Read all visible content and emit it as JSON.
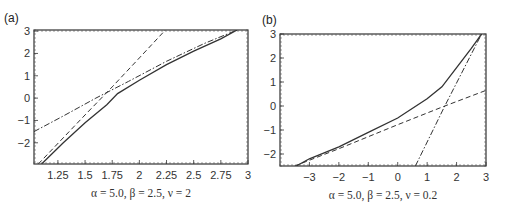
{
  "chart_data": [
    {
      "type": "line",
      "panel_label": "(a)",
      "title": "",
      "xlabel": "α = 5.0, β = 2.5, ν = 2",
      "ylabel": "",
      "xlim": [
        1.03,
        3.0
      ],
      "ylim": [
        -2.95,
        3.05
      ],
      "xticks": [
        1.25,
        1.5,
        1.75,
        2,
        2.25,
        2.5,
        2.75,
        3
      ],
      "xtick_labels": [
        "1.25",
        "1.5",
        "1.75",
        "2",
        "2.25",
        "2.5",
        "2.75",
        "3"
      ],
      "yticks": [
        -2,
        -1,
        0,
        1,
        2,
        3
      ],
      "ytick_labels": [
        "−2",
        "−1",
        "0",
        "1",
        "2",
        "3"
      ],
      "grid": false,
      "legend": null,
      "series": [
        {
          "name": "solid",
          "style": "solid",
          "x": [
            1.1,
            1.3,
            1.5,
            1.7,
            1.8,
            2.0,
            2.25,
            2.5,
            2.75,
            2.9
          ],
          "y": [
            -2.95,
            -2.0,
            -1.1,
            -0.3,
            0.2,
            0.8,
            1.5,
            2.1,
            2.65,
            3.05
          ]
        },
        {
          "name": "dashed",
          "style": "dashed",
          "x": [
            1.07,
            1.5,
            1.75,
            2.0,
            2.24
          ],
          "y": [
            -2.95,
            -0.75,
            0.5,
            1.8,
            3.05
          ]
        },
        {
          "name": "dash-dot",
          "style": "dashdot",
          "x": [
            1.03,
            1.3,
            1.6,
            1.9,
            2.25,
            2.6,
            2.9
          ],
          "y": [
            -1.5,
            -0.8,
            0.0,
            0.75,
            1.65,
            2.45,
            3.05
          ]
        }
      ]
    },
    {
      "type": "line",
      "panel_label": "(b)",
      "title": "",
      "xlabel": "α = 5.0, β = 2.5, ν = 0.2",
      "ylabel": "",
      "xlim": [
        -4.0,
        3.0
      ],
      "ylim": [
        -2.5,
        3.0
      ],
      "xticks": [
        -3,
        -2,
        -1,
        0,
        1,
        2,
        3
      ],
      "xtick_labels": [
        "−3",
        "−2",
        "−1",
        "0",
        "1",
        "2",
        "3"
      ],
      "yticks": [
        -2,
        -1,
        0,
        1,
        2,
        3
      ],
      "ytick_labels": [
        "−2",
        "−1",
        "0",
        "1",
        "2",
        "3"
      ],
      "grid": false,
      "legend": null,
      "series": [
        {
          "name": "solid",
          "style": "solid",
          "x": [
            -3.45,
            -3.0,
            -2.0,
            -1.0,
            0.0,
            1.0,
            1.5,
            2.0,
            2.5,
            2.85
          ],
          "y": [
            -2.5,
            -2.2,
            -1.7,
            -1.1,
            -0.5,
            0.3,
            0.8,
            1.6,
            2.4,
            3.0
          ]
        },
        {
          "name": "dashed",
          "style": "dashed",
          "x": [
            -3.5,
            -2.0,
            0.0,
            1.6,
            3.0
          ],
          "y": [
            -2.5,
            -1.78,
            -0.78,
            0.0,
            0.65
          ]
        },
        {
          "name": "dash-dot",
          "style": "dashdot",
          "x": [
            0.6,
            1.6,
            2.85
          ],
          "y": [
            -2.5,
            0.0,
            3.0
          ]
        }
      ]
    }
  ]
}
